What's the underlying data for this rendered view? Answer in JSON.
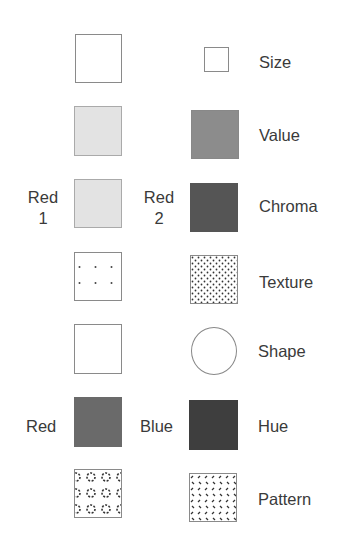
{
  "variables": [
    {
      "label": "Size",
      "left_caption": "",
      "right_caption": ""
    },
    {
      "label": "Value",
      "left_caption": "",
      "right_caption": ""
    },
    {
      "label": "Chroma",
      "left_caption_line1": "Red",
      "left_caption_line2": "1",
      "right_caption_line1": "Red",
      "right_caption_line2": "2"
    },
    {
      "label": "Texture",
      "left_caption": "",
      "right_caption": ""
    },
    {
      "label": "Shape",
      "left_caption": "",
      "right_caption": ""
    },
    {
      "label": "Hue",
      "left_caption": "Red",
      "right_caption": "Blue"
    },
    {
      "label": "Pattern",
      "left_caption": "",
      "right_caption": ""
    }
  ],
  "colors": {
    "value_light": "#e3e3e3",
    "value_dark": "#8c8c8c",
    "chroma_light": "#e3e3e3",
    "chroma_dark": "#555555",
    "hue_red": "#6a6a6a",
    "hue_blue": "#3e3e3e"
  }
}
